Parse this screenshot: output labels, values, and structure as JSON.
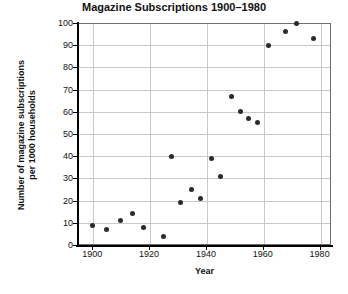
{
  "chart_data": {
    "type": "scatter",
    "title": "Magazine Subscriptions 1900–1980",
    "xlabel": "Year",
    "ylabel": "Number of magazine subscriptions per 1000 households",
    "ylabel_lines": [
      "Number of magazine subscriptions",
      "per 1000 households"
    ],
    "xlim": [
      1895,
      1984
    ],
    "ylim": [
      0,
      100
    ],
    "xticks": [
      1900,
      1920,
      1940,
      1960,
      1980
    ],
    "yticks": [
      0,
      10,
      20,
      30,
      40,
      50,
      60,
      70,
      80,
      90,
      100
    ],
    "grid": true,
    "legend": null,
    "marker_color": "#2b2b2b",
    "points": [
      {
        "x": 1900,
        "y": 9
      },
      {
        "x": 1905,
        "y": 7
      },
      {
        "x": 1910,
        "y": 11
      },
      {
        "x": 1914,
        "y": 14
      },
      {
        "x": 1918,
        "y": 8
      },
      {
        "x": 1925,
        "y": 4
      },
      {
        "x": 1928,
        "y": 40
      },
      {
        "x": 1931,
        "y": 19
      },
      {
        "x": 1935,
        "y": 25
      },
      {
        "x": 1938,
        "y": 21
      },
      {
        "x": 1942,
        "y": 39
      },
      {
        "x": 1945,
        "y": 31
      },
      {
        "x": 1949,
        "y": 67
      },
      {
        "x": 1952,
        "y": 60
      },
      {
        "x": 1955,
        "y": 57
      },
      {
        "x": 1958,
        "y": 55
      },
      {
        "x": 1962,
        "y": 90
      },
      {
        "x": 1968,
        "y": 96
      },
      {
        "x": 1972,
        "y": 100
      },
      {
        "x": 1978,
        "y": 93
      }
    ]
  }
}
